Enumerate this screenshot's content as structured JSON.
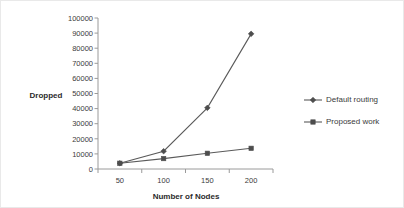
{
  "chart_data": {
    "type": "line",
    "title": "",
    "subtitle": "",
    "xlabel": "Number of Nodes",
    "ylabel": "Dropped",
    "categories": [
      50,
      100,
      150,
      200
    ],
    "x_tick_labels": [
      "50",
      "100",
      "150",
      "200"
    ],
    "y_tick_labels": [
      "0",
      "10000",
      "20000",
      "30000",
      "40000",
      "50000",
      "60000",
      "70000",
      "80000",
      "90000",
      "100000"
    ],
    "y_ticks": [
      0,
      10000,
      20000,
      30000,
      40000,
      50000,
      60000,
      70000,
      80000,
      90000,
      100000
    ],
    "ylim": [
      0,
      100000
    ],
    "grid": false,
    "legend_position": "right",
    "series": [
      {
        "name": "Default routing",
        "marker": "diamond",
        "color": "#4d4d4d",
        "values": [
          3800,
          11800,
          40500,
          89500
        ]
      },
      {
        "name": "Proposed work",
        "marker": "square",
        "color": "#4d4d4d",
        "values": [
          3800,
          6900,
          10400,
          13700
        ]
      }
    ]
  },
  "legend": {
    "entries": [
      {
        "label": "Default routing",
        "marker": "diamond"
      },
      {
        "label": "Proposed work",
        "marker": "square"
      }
    ]
  },
  "colors": {
    "series": "#4d4d4d",
    "line": "#5a5a5a",
    "axis": "#9a9a9a",
    "text": "#3b3b3b",
    "background": "#ffffff"
  }
}
